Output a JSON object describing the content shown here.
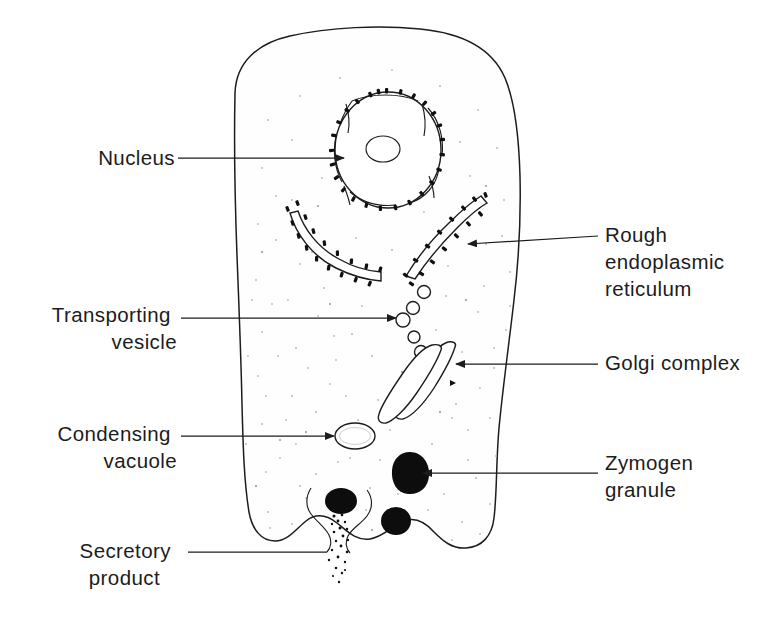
{
  "figure": {
    "background_color": "#ffffff",
    "ink_color": "#1c1c1c",
    "granule_color": "#0d0d0d",
    "cytoplasm_color": "#fefefe"
  },
  "labels": [
    {
      "id": "nucleus",
      "text": "Nucleus",
      "side": "left",
      "lines": [
        "Nucleus"
      ],
      "text_x": 175,
      "text_y": 165,
      "leader": {
        "x1": 178,
        "y1": 158,
        "x2": 344,
        "y2": 158,
        "arrow": true
      }
    },
    {
      "id": "rough-endoplasmic-reticulum",
      "text": "Rough endoplasmic reticulum",
      "side": "right",
      "lines": [
        "Rough",
        "endoplasmic",
        "reticulum"
      ],
      "text_x": 605,
      "text_y": 242,
      "line_height": 27,
      "leader": {
        "x1": 598,
        "y1": 236,
        "x2": 466,
        "y2": 244,
        "arrow": true
      }
    },
    {
      "id": "transporting-vesicle",
      "text": "Transporting vesicle",
      "side": "left",
      "lines": [
        "Transporting",
        "vesicle"
      ],
      "text_x": 177,
      "text_y": 322,
      "line_height": 27,
      "leader": {
        "x1": 181,
        "y1": 318,
        "x2": 396,
        "y2": 318,
        "arrow": true
      }
    },
    {
      "id": "golgi-complex",
      "text": "Golgi complex",
      "side": "right",
      "lines": [
        "Golgi complex"
      ],
      "text_x": 605,
      "text_y": 370,
      "leader": {
        "x1": 598,
        "y1": 364,
        "x2": 456,
        "y2": 364,
        "arrow": true
      }
    },
    {
      "id": "condensing-vacuole",
      "text": "Condensing vacuole",
      "side": "left",
      "lines": [
        "Condensing",
        "vacuole"
      ],
      "text_x": 177,
      "text_y": 441,
      "line_height": 27,
      "leader": {
        "x1": 181,
        "y1": 436,
        "x2": 334,
        "y2": 436,
        "arrow": true
      }
    },
    {
      "id": "zymogen-granule",
      "text": "Zymogen granule",
      "side": "right",
      "lines": [
        "Zymogen",
        "granule"
      ],
      "text_x": 605,
      "text_y": 470,
      "line_height": 27,
      "leader": {
        "x1": 598,
        "y1": 473,
        "x2": 423,
        "y2": 473,
        "arrow": true
      }
    },
    {
      "id": "secretory-product",
      "text": "Secretory product",
      "side": "left",
      "lines": [
        "Secretory",
        "product"
      ],
      "text_x": 177,
      "text_y": 558,
      "line_height": 27,
      "leader": {
        "x1": 188,
        "y1": 552,
        "x2": 327,
        "y2": 552,
        "arrow": false
      }
    }
  ],
  "structures": {
    "cell": {
      "name": "acinar cell outline",
      "count": 1
    },
    "nucleus": {
      "name": "nucleus",
      "center_x": 388,
      "center_y": 150,
      "radius_x": 53,
      "radius_y": 58,
      "nucleolus": {
        "center_x": 383,
        "center_y": 149,
        "radius_x": 17,
        "radius_y": 13
      },
      "nuclear_pores": 4,
      "ribosome_count": 26
    },
    "rough_er": [
      {
        "name": "left cisterna",
        "ribosome_count": 17
      },
      {
        "name": "right cisterna",
        "ribosome_count": 15
      }
    ],
    "transport_vesicles": {
      "name": "transporting vesicles",
      "count": 5,
      "positions": [
        {
          "cx": 424,
          "cy": 292,
          "r": 6.5
        },
        {
          "cx": 413,
          "cy": 308,
          "r": 6.5
        },
        {
          "cx": 403,
          "cy": 320,
          "r": 7.0
        },
        {
          "cx": 414,
          "cy": 337,
          "r": 6.0
        },
        {
          "cx": 421,
          "cy": 352,
          "r": 6.5
        }
      ]
    },
    "golgi": {
      "name": "golgi complex",
      "cisternae": 2
    },
    "condensing_vacuole": {
      "name": "condensing vacuole",
      "cx": 355,
      "cy": 436,
      "rx": 20,
      "ry": 13
    },
    "zymogen_granules": {
      "name": "zymogen granules",
      "count": 3,
      "positions": [
        {
          "cx": 410,
          "cy": 473,
          "rx": 19,
          "ry": 21
        },
        {
          "cx": 396,
          "cy": 521,
          "rx": 15,
          "ry": 14
        },
        {
          "cx": 341,
          "cy": 501,
          "rx": 16,
          "ry": 13
        }
      ]
    },
    "exocytosis": {
      "name": "exocytosis at apical membrane",
      "secreted_specks": 22
    }
  }
}
